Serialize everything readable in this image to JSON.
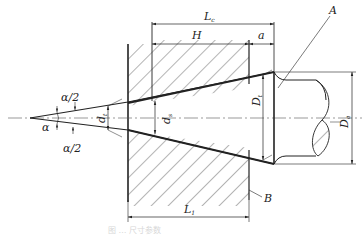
{
  "diagram": {
    "type": "engineering cross-section",
    "labels": {
      "Lc": {
        "main": "L",
        "sub": "c"
      },
      "H": "H",
      "a": "a",
      "A": "A",
      "B": "B",
      "half_angle_top": "α/2",
      "half_angle_bottom": "α/2",
      "alpha": "α",
      "dt": {
        "main": "d",
        "sub": "t"
      },
      "ds": {
        "main": "d",
        "sub": "s"
      },
      "Dt": {
        "main": "D",
        "sub": "t"
      },
      "Da": {
        "main": "D",
        "sub": "a"
      },
      "L1": {
        "main": "L",
        "sub": "1"
      }
    },
    "caption": "图 … 尺寸参数"
  },
  "colors": {
    "line": "#222222",
    "hatch": "#444444",
    "centerline": "#555555",
    "caption": "#d8d8d8"
  }
}
